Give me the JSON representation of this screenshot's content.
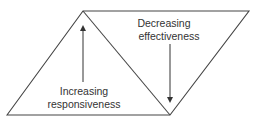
{
  "diagram": {
    "labels": {
      "left_line1": "Increasing",
      "left_line2": "responsiveness",
      "right_line1": "Decreasing",
      "right_line2": "effectiveness"
    },
    "colors": {
      "stroke": "#333333",
      "background": "#ffffff"
    }
  }
}
